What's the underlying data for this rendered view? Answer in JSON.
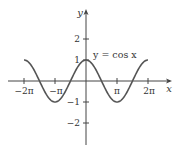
{
  "chart_data": {
    "type": "line",
    "title": "",
    "xlabel": "x",
    "ylabel": "y",
    "annotation": "y = cos x",
    "x_tick_labels": [
      "−2π",
      "−π",
      "π",
      "2π"
    ],
    "x_tick_values": [
      -6.2832,
      -3.1416,
      3.1416,
      6.2832
    ],
    "y_tick_labels": [
      "2",
      "1",
      "−1",
      "−2"
    ],
    "y_tick_values": [
      2,
      1,
      -1,
      -2
    ],
    "xlim": [
      -6.2832,
      6.2832
    ],
    "ylim": [
      -2.7,
      2.9
    ],
    "grid": false,
    "legend": "none",
    "series": [
      {
        "name": "y = cos x",
        "x": [
          -6.2832,
          -4.7124,
          -3.1416,
          -1.5708,
          0,
          1.5708,
          3.1416,
          4.7124,
          6.2832
        ],
        "values": [
          1,
          0,
          -1,
          0,
          1,
          0,
          -1,
          0,
          1
        ]
      }
    ]
  },
  "labels": {
    "x_axis": "x",
    "y_axis": "y",
    "curve": "y = cos x",
    "xt_m2pi": "−2π",
    "xt_mpi": "−π",
    "xt_pi": "π",
    "xt_2pi": "2π",
    "yt_2": "2",
    "yt_1": "1",
    "yt_m1": "−1",
    "yt_m2": "−2"
  },
  "colors": {
    "axis": "#444444",
    "curve": "#555555",
    "text": "#333333"
  }
}
